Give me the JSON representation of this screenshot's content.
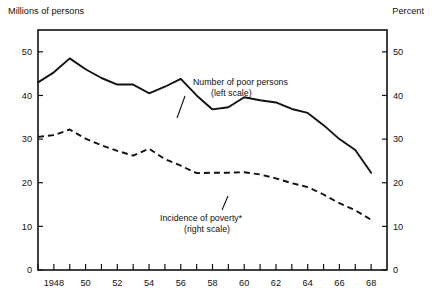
{
  "chart_data": {
    "type": "line",
    "title": "",
    "subtitle": "",
    "xlabel": "",
    "ylabel": "Millions of persons",
    "y2label": "Percent",
    "left_axis_caption": "Millions of persons",
    "right_axis_caption": "Percent",
    "grid": false,
    "legend_position": "inline-annotation",
    "xlim": [
      1947,
      1969
    ],
    "ylim": [
      0,
      55
    ],
    "y2lim": [
      0,
      55
    ],
    "ytick_labels": [
      "0",
      "10",
      "20",
      "30",
      "40",
      "50"
    ],
    "ytick_values": [
      0,
      10,
      20,
      30,
      40,
      50
    ],
    "y2tick_labels": [
      "0",
      "10",
      "20",
      "30",
      "40",
      "50"
    ],
    "y2tick_values": [
      0,
      10,
      20,
      30,
      40,
      50
    ],
    "xtick_values": [
      1947,
      1948,
      1949,
      1950,
      1951,
      1952,
      1953,
      1954,
      1955,
      1956,
      1957,
      1958,
      1959,
      1960,
      1961,
      1962,
      1963,
      1964,
      1965,
      1966,
      1967,
      1968
    ],
    "xtick_labels": [
      "",
      "1948",
      "",
      "50",
      "",
      "52",
      "",
      "54",
      "",
      "56",
      "",
      "58",
      "",
      "60",
      "",
      "62",
      "",
      "64",
      "",
      "66",
      "",
      "68"
    ],
    "x": [
      1947,
      1948,
      1949,
      1950,
      1951,
      1952,
      1953,
      1954,
      1955,
      1956,
      1957,
      1958,
      1959,
      1960,
      1961,
      1962,
      1963,
      1964,
      1965,
      1966,
      1967,
      1968
    ],
    "series": [
      {
        "name": "Number of poor persons",
        "scale": "left",
        "style": "solid",
        "annotation_line1": "Number of poor persons",
        "annotation_line2": "(left scale)",
        "values": [
          43.0,
          45.3,
          48.5,
          46.0,
          44.0,
          42.5,
          42.5,
          40.5,
          42.0,
          43.8,
          40.0,
          36.8,
          37.3,
          39.6,
          38.9,
          38.4,
          36.9,
          36.0,
          33.2,
          30.0,
          27.5,
          22.3
        ]
      },
      {
        "name": "Incidence of poverty*",
        "scale": "right",
        "style": "dashed",
        "annotation_line1": "Incidence of poverty*",
        "annotation_line2": "(right scale)",
        "values": [
          30.5,
          30.9,
          32.2,
          30.1,
          28.6,
          27.3,
          26.2,
          27.8,
          25.4,
          23.9,
          22.2,
          22.3,
          22.3,
          22.4,
          21.9,
          21.0,
          19.9,
          19.0,
          17.3,
          15.3,
          13.7,
          11.5
        ]
      }
    ]
  },
  "annotations": {
    "poor_persons": {
      "line1": "Number of poor persons",
      "line2": "(left scale)"
    },
    "incidence": {
      "line1": "Incidence of poverty*",
      "line2": "(right scale)"
    }
  }
}
